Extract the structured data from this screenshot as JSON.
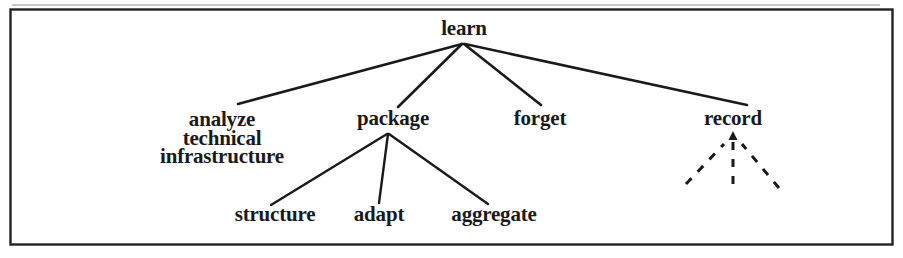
{
  "figure": {
    "title": "",
    "border_color": "#222222",
    "background_color": "#ffffff",
    "ink_color": "#1a1a1a"
  },
  "diagram": {
    "type": "tree",
    "root": "learn",
    "nodes": [
      {
        "id": "learn",
        "label": "learn",
        "x": 464,
        "y": 30,
        "level": 0
      },
      {
        "id": "analyze",
        "label": "analyze\ntechnical\ninfrastructure",
        "x": 222,
        "y": 120,
        "level": 1
      },
      {
        "id": "package",
        "label": "package",
        "x": 393,
        "y": 120,
        "level": 1
      },
      {
        "id": "forget",
        "label": "forget",
        "x": 540,
        "y": 120,
        "level": 1
      },
      {
        "id": "record",
        "label": "record",
        "x": 733,
        "y": 120,
        "level": 1
      },
      {
        "id": "structure",
        "label": "structure",
        "x": 275,
        "y": 216,
        "level": 2
      },
      {
        "id": "adapt",
        "label": "adapt",
        "x": 379,
        "y": 216,
        "level": 2
      },
      {
        "id": "aggregate",
        "label": "aggregate",
        "x": 494,
        "y": 216,
        "level": 2
      }
    ],
    "edges": [
      {
        "from": "learn",
        "to": "analyze",
        "style": "solid"
      },
      {
        "from": "learn",
        "to": "package",
        "style": "solid"
      },
      {
        "from": "learn",
        "to": "forget",
        "style": "solid"
      },
      {
        "from": "learn",
        "to": "record",
        "style": "solid"
      },
      {
        "from": "package",
        "to": "structure",
        "style": "solid"
      },
      {
        "from": "package",
        "to": "adapt",
        "style": "solid"
      },
      {
        "from": "package",
        "to": "aggregate",
        "style": "solid"
      }
    ],
    "dashed_arrows": {
      "target": "record",
      "count": 3,
      "style": "dashed",
      "arrowhead": "up",
      "note": "three dashed lines converge upward into an arrowhead beneath record"
    },
    "labels": {
      "learn": "learn",
      "analyze_line1": "analyze",
      "analyze_line2": "technical",
      "analyze_line3": "infrastructure",
      "package": "package",
      "forget": "forget",
      "record": "record",
      "structure": "structure",
      "adapt": "adapt",
      "aggregate": "aggregate"
    }
  }
}
